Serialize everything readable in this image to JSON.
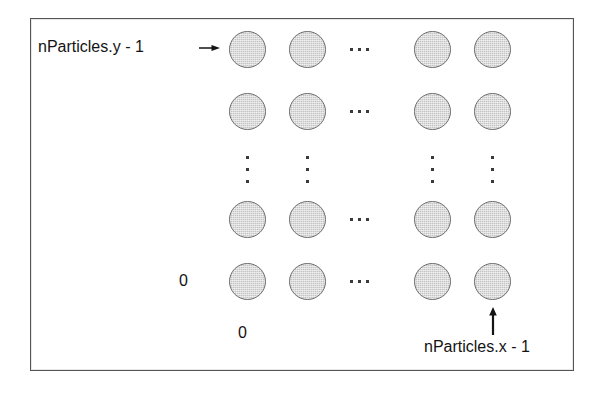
{
  "figure": {
    "kind": "particle-grid-diagram",
    "frame": {
      "border_color": "#555555",
      "background": "#ffffff"
    },
    "labels": {
      "y_max": "nParticles.y - 1",
      "y_min": "0",
      "x_min": "0",
      "x_max": "nParticles.x - 1"
    },
    "annotations": {
      "y_max_arrow": "arrow-right-icon",
      "x_max_arrow": "arrow-up-icon",
      "row_continuation": "vertical-ellipsis",
      "column_continuation": "horizontal-ellipsis"
    },
    "grid": {
      "columns": 4,
      "rows": 4,
      "column_gap_marker_index": 2,
      "row_gap_marker_index": 2,
      "particle": {
        "shape": "circle",
        "diameter_px": 37,
        "fill": "#c3c3c3",
        "stroke": "#6e6e6e"
      },
      "column_x": [
        228,
        288,
        413,
        473
      ],
      "row_y": [
        30,
        92,
        200,
        262
      ],
      "ellipsis_h_x": 349,
      "ellipsis_v_y": 155
    }
  }
}
